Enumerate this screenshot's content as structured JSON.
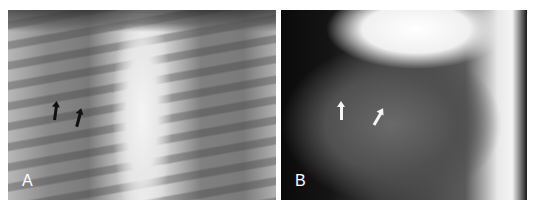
{
  "figure": {
    "panels": [
      {
        "label": "A",
        "view": "frontal chest radiograph",
        "arrows": [
          {
            "color": "#111111",
            "x": 54,
            "y": 104,
            "rotate": 8
          },
          {
            "color": "#111111",
            "x": 77,
            "y": 111,
            "rotate": 15
          }
        ]
      },
      {
        "label": "B",
        "view": "lateral chest radiograph",
        "arrows": [
          {
            "color": "#f5f5f5",
            "x": 60,
            "y": 96,
            "rotate": 0
          },
          {
            "color": "#f5f5f5",
            "x": 97,
            "y": 104,
            "rotate": 30
          }
        ]
      }
    ]
  }
}
